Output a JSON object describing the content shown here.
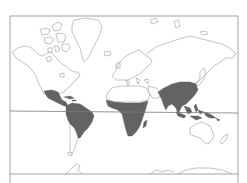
{
  "map": {
    "projection": "mercator",
    "colors": {
      "background": "#ffffff",
      "frame": "#8c8c8c",
      "coastline": "#9a9a9a",
      "shaded_region": "#636363",
      "equator": "#7a7a7a"
    },
    "lines": [
      "frame",
      "equator",
      "bottom-parallel"
    ],
    "shaded_regions": [
      "Central America & Mexico",
      "Caribbean",
      "South America (tropical)",
      "Sub-Saharan Africa",
      "Madagascar",
      "South & Southeast Asia",
      "Maritime Southeast Asia",
      "New Guinea"
    ],
    "unshaded_landmasses": [
      "North America",
      "Greenland",
      "Europe",
      "North Africa",
      "Russia & Northern Asia",
      "Japan",
      "Australia",
      "New Zealand",
      "Southern South America",
      "Antarctica"
    ]
  }
}
